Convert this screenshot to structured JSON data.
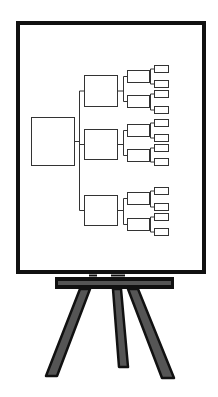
{
  "illustration": {
    "subject": "easel-with-org-chart",
    "colors": {
      "background": "#ffffff",
      "frame": "#111111",
      "board": "#ffffff",
      "diagram_line": "#333333",
      "easel_outline": "#111111",
      "easel_fill": "#555555"
    },
    "board": {
      "x": 16,
      "y": 21,
      "width": 190,
      "height": 253,
      "border": 4
    },
    "tree": {
      "root": {
        "x": 31,
        "y": 117,
        "w": 43,
        "h": 48
      },
      "trunk_x": 79,
      "groups": [
        {
          "box": {
            "x": 84,
            "y": 75,
            "w": 33,
            "h": 31
          },
          "children": [
            {
              "box": {
                "x": 127,
                "y": 70,
                "w": 22,
                "h": 12
              },
              "leaves": [
                {
                  "y": 65
                },
                {
                  "y": 80
                }
              ]
            },
            {
              "box": {
                "x": 127,
                "y": 95,
                "w": 22,
                "h": 12
              },
              "leaves": [
                {
                  "y": 90
                },
                {
                  "y": 106
                }
              ]
            }
          ]
        },
        {
          "box": {
            "x": 84,
            "y": 129,
            "w": 33,
            "h": 30
          },
          "children": [
            {
              "box": {
                "x": 127,
                "y": 124,
                "w": 22,
                "h": 12
              },
              "leaves": [
                {
                  "y": 119
                },
                {
                  "y": 134
                }
              ]
            },
            {
              "box": {
                "x": 127,
                "y": 149,
                "w": 22,
                "h": 12
              },
              "leaves": [
                {
                  "y": 144
                },
                {
                  "y": 158
                }
              ]
            }
          ]
        },
        {
          "box": {
            "x": 84,
            "y": 195,
            "w": 33,
            "h": 30
          },
          "children": [
            {
              "box": {
                "x": 127,
                "y": 192,
                "w": 22,
                "h": 12
              },
              "leaves": [
                {
                  "y": 187
                },
                {
                  "y": 203
                }
              ]
            },
            {
              "box": {
                "x": 127,
                "y": 218,
                "w": 22,
                "h": 12
              },
              "leaves": [
                {
                  "y": 213
                },
                {
                  "y": 228
                }
              ]
            }
          ]
        }
      ],
      "leaf_x": 154,
      "leaf_w": 14,
      "leaf_h": 7
    },
    "easel": {
      "crossbar": {
        "x": 55,
        "y": 277,
        "w": 119,
        "h": 12
      },
      "legs": [
        {
          "name": "left",
          "points": "80,289 90,289 57,376 46,376"
        },
        {
          "name": "center",
          "points": "113,289 121,289 128,367 119,367"
        },
        {
          "name": "right",
          "points": "128,289 138,289 174,378 162,378"
        }
      ]
    }
  }
}
